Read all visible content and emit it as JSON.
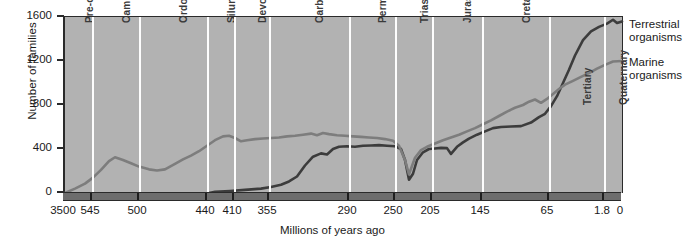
{
  "chart_data": {
    "type": "line",
    "title": "",
    "xlabel": "Millions of years ago",
    "ylabel": "Number of families",
    "ylim": [
      0,
      1600
    ],
    "yticks": [
      0,
      400,
      800,
      1200,
      1600
    ],
    "xticks": [
      "3500",
      "545",
      "500",
      "440",
      "410",
      "355",
      "290",
      "250",
      "205",
      "145",
      "65",
      "1.8",
      "0"
    ],
    "x_axis_direction": "reversed",
    "grid": false,
    "legend_position": "right",
    "colors": {
      "terrestrial": "#3c3c3c",
      "marine": "#7d7d7d",
      "plot_background": "#b2b2b2",
      "separator": "#fdfdfd",
      "time_band": "#6d6d6d",
      "axis": "#2a2a2a"
    },
    "periods": [
      {
        "name": "Pre-cambrian",
        "x_start": 0,
        "x_end": 27
      },
      {
        "name": "Cambrian",
        "x_start": 27,
        "x_end": 74
      },
      {
        "name": "Ordovician",
        "x_start": 74,
        "x_end": 142
      },
      {
        "name": "Silurian",
        "x_start": 142,
        "x_end": 169
      },
      {
        "name": "Devonian",
        "x_start": 169,
        "x_end": 204
      },
      {
        "name": "Carboniferous",
        "x_start": 204,
        "x_end": 284
      },
      {
        "name": "Permian",
        "x_start": 284,
        "x_end": 330
      },
      {
        "name": "Triassic",
        "x_start": 330,
        "x_end": 367
      },
      {
        "name": "Jurassic",
        "x_start": 367,
        "x_end": 417
      },
      {
        "name": "Cretaceous",
        "x_start": 417,
        "x_end": 484
      },
      {
        "name": "Tertiary",
        "x_start": 484,
        "x_end": 539
      },
      {
        "name": "Quaternary",
        "x_start": 539,
        "x_end": 557
      }
    ],
    "series": [
      {
        "name": "Terrestrial organisms",
        "color": "#3c3c3c",
        "points": [
          [
            144,
            0
          ],
          [
            150,
            10
          ],
          [
            165,
            18
          ],
          [
            180,
            28
          ],
          [
            196,
            40
          ],
          [
            206,
            55
          ],
          [
            216,
            75
          ],
          [
            224,
            105
          ],
          [
            232,
            150
          ],
          [
            240,
            250
          ],
          [
            248,
            330
          ],
          [
            256,
            360
          ],
          [
            262,
            350
          ],
          [
            268,
            400
          ],
          [
            274,
            420
          ],
          [
            282,
            425
          ],
          [
            290,
            420
          ],
          [
            298,
            430
          ],
          [
            306,
            432
          ],
          [
            314,
            435
          ],
          [
            322,
            430
          ],
          [
            330,
            425
          ],
          [
            336,
            400
          ],
          [
            340,
            300
          ],
          [
            344,
            120
          ],
          [
            348,
            175
          ],
          [
            352,
            300
          ],
          [
            358,
            370
          ],
          [
            364,
            400
          ],
          [
            370,
            405
          ],
          [
            376,
            410
          ],
          [
            382,
            408
          ],
          [
            386,
            355
          ],
          [
            392,
            420
          ],
          [
            398,
            460
          ],
          [
            404,
            495
          ],
          [
            412,
            530
          ],
          [
            420,
            560
          ],
          [
            428,
            590
          ],
          [
            436,
            600
          ],
          [
            446,
            605
          ],
          [
            456,
            608
          ],
          [
            466,
            640
          ],
          [
            474,
            690
          ],
          [
            480,
            720
          ],
          [
            486,
            790
          ],
          [
            492,
            880
          ],
          [
            498,
            1000
          ],
          [
            504,
            1120
          ],
          [
            510,
            1250
          ],
          [
            518,
            1390
          ],
          [
            526,
            1470
          ],
          [
            534,
            1510
          ],
          [
            542,
            1540
          ],
          [
            548,
            1575
          ],
          [
            552,
            1545
          ],
          [
            557,
            1560
          ]
        ]
      },
      {
        "name": "Marine organisms",
        "color": "#7d7d7d",
        "points": [
          [
            0,
            0
          ],
          [
            10,
            40
          ],
          [
            20,
            85
          ],
          [
            28,
            140
          ],
          [
            36,
            210
          ],
          [
            44,
            290
          ],
          [
            50,
            325
          ],
          [
            58,
            300
          ],
          [
            66,
            270
          ],
          [
            74,
            240
          ],
          [
            84,
            215
          ],
          [
            92,
            205
          ],
          [
            100,
            215
          ],
          [
            110,
            265
          ],
          [
            118,
            305
          ],
          [
            126,
            340
          ],
          [
            134,
            380
          ],
          [
            142,
            430
          ],
          [
            150,
            480
          ],
          [
            158,
            515
          ],
          [
            164,
            520
          ],
          [
            170,
            500
          ],
          [
            176,
            470
          ],
          [
            182,
            480
          ],
          [
            190,
            490
          ],
          [
            198,
            495
          ],
          [
            206,
            500
          ],
          [
            214,
            505
          ],
          [
            222,
            515
          ],
          [
            230,
            520
          ],
          [
            238,
            530
          ],
          [
            246,
            540
          ],
          [
            252,
            525
          ],
          [
            258,
            545
          ],
          [
            264,
            535
          ],
          [
            272,
            525
          ],
          [
            280,
            520
          ],
          [
            288,
            515
          ],
          [
            296,
            510
          ],
          [
            304,
            505
          ],
          [
            312,
            500
          ],
          [
            320,
            490
          ],
          [
            328,
            475
          ],
          [
            334,
            430
          ],
          [
            340,
            300
          ],
          [
            344,
            170
          ],
          [
            350,
            320
          ],
          [
            356,
            390
          ],
          [
            362,
            420
          ],
          [
            370,
            450
          ],
          [
            378,
            480
          ],
          [
            386,
            505
          ],
          [
            394,
            530
          ],
          [
            402,
            560
          ],
          [
            410,
            590
          ],
          [
            418,
            625
          ],
          [
            426,
            660
          ],
          [
            434,
            700
          ],
          [
            442,
            740
          ],
          [
            450,
            775
          ],
          [
            458,
            800
          ],
          [
            464,
            830
          ],
          [
            470,
            850
          ],
          [
            476,
            820
          ],
          [
            482,
            855
          ],
          [
            488,
            900
          ],
          [
            494,
            945
          ],
          [
            500,
            985
          ],
          [
            508,
            1020
          ],
          [
            516,
            1055
          ],
          [
            524,
            1090
          ],
          [
            532,
            1130
          ],
          [
            540,
            1165
          ],
          [
            548,
            1195
          ],
          [
            557,
            1200
          ]
        ]
      }
    ],
    "x_tick_positions": [
      0,
      27,
      74,
      142,
      169,
      204,
      284,
      330,
      367,
      417,
      484,
      539,
      557
    ],
    "band_tick_positions": [
      27,
      74,
      142,
      169,
      204,
      284,
      330,
      367,
      417,
      484,
      539
    ]
  },
  "axes": {
    "ylabel": "Number of families",
    "xlabel": "Millions of years ago",
    "yticks": [
      "1600",
      "1200",
      "800",
      "400",
      "0"
    ]
  },
  "legend": {
    "items": [
      {
        "label_line1": "Terrestrial",
        "label_line2": "organisms"
      },
      {
        "label_line1": "Marine",
        "label_line2": "organisms"
      }
    ]
  }
}
